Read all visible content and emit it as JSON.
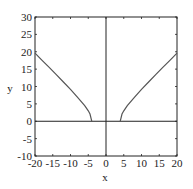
{
  "chart_data": {
    "type": "line",
    "title": "",
    "xlabel": "x",
    "ylabel": "y",
    "xlim": [
      -20,
      20
    ],
    "ylim": [
      -10,
      30
    ],
    "grid": false,
    "legend": null,
    "x_ticks": [
      -20,
      -15,
      -10,
      -5,
      0,
      5,
      10,
      15,
      20
    ],
    "y_ticks": [
      -10,
      -5,
      0,
      5,
      10,
      15,
      20,
      25,
      30
    ],
    "x_tick_labels": [
      "-20",
      "-15",
      "-10",
      "-5",
      "0",
      "5",
      "10",
      "15",
      "20"
    ],
    "y_tick_labels": [
      "-10",
      "-5",
      "0",
      "5",
      "10",
      "15",
      "20",
      "25",
      "30"
    ],
    "series": [
      {
        "name": "left branch",
        "x": [
          -20,
          -18,
          -16,
          -14,
          -12,
          -10,
          -8,
          -6,
          -5,
          -4.5,
          -4
        ],
        "y": [
          19.6,
          17.5,
          15.5,
          13.4,
          11.3,
          9.2,
          6.9,
          4.5,
          3.0,
          2.1,
          0
        ]
      },
      {
        "name": "right branch",
        "x": [
          4,
          4.5,
          5,
          6,
          8,
          10,
          12,
          14,
          16,
          18,
          20
        ],
        "y": [
          0,
          2.1,
          3.0,
          4.5,
          6.9,
          9.2,
          11.3,
          13.4,
          15.5,
          17.5,
          19.6
        ]
      }
    ],
    "colors": {
      "curve": "#555555",
      "axes": "#222222"
    }
  }
}
